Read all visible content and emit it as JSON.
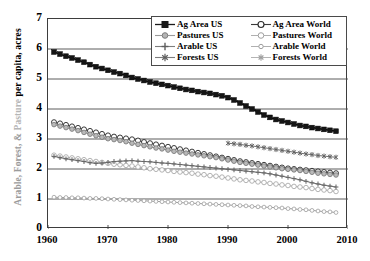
{
  "chart_data": {
    "type": "line",
    "title": "",
    "subtitle": "",
    "xlabel": "",
    "ylabel": "Arable, Forest, & Pasture per capita, acres",
    "ylabel_parts": [
      {
        "text": "Arable, Forest, & ",
        "color": "#9b9b9b"
      },
      {
        "text": "Pasture ",
        "color": "#b6b6b6"
      },
      {
        "text": "per capita, acres",
        "color": "#000000"
      }
    ],
    "xlim": [
      1960,
      2010
    ],
    "ylim": [
      0,
      7
    ],
    "xticks": [
      1960,
      1970,
      1980,
      1990,
      2000,
      2010
    ],
    "yticks": [
      0,
      1,
      2,
      3,
      4,
      5,
      6,
      7
    ],
    "grid": "horizontal",
    "legend_position": "top-right-inside",
    "series": [
      {
        "name": "Ag Area US",
        "marker": "filled-square",
        "color": "#1a1a1a",
        "x": [
          1961,
          1962,
          1963,
          1964,
          1965,
          1966,
          1967,
          1968,
          1969,
          1970,
          1971,
          1972,
          1973,
          1974,
          1975,
          1976,
          1977,
          1978,
          1979,
          1980,
          1981,
          1982,
          1983,
          1984,
          1985,
          1986,
          1987,
          1988,
          1989,
          1990,
          1991,
          1992,
          1993,
          1994,
          1995,
          1996,
          1997,
          1998,
          1999,
          2000,
          2001,
          2002,
          2003,
          2004,
          2005,
          2006,
          2007,
          2008
        ],
        "values": [
          5.9,
          5.83,
          5.76,
          5.7,
          5.63,
          5.56,
          5.48,
          5.41,
          5.35,
          5.29,
          5.23,
          5.18,
          5.12,
          5.05,
          5.0,
          4.95,
          4.9,
          4.86,
          4.82,
          4.78,
          4.73,
          4.69,
          4.65,
          4.62,
          4.58,
          4.55,
          4.52,
          4.48,
          4.44,
          4.38,
          4.3,
          4.2,
          4.1,
          4.0,
          3.9,
          3.8,
          3.72,
          3.65,
          3.6,
          3.55,
          3.5,
          3.45,
          3.42,
          3.38,
          3.35,
          3.32,
          3.29,
          3.26
        ]
      },
      {
        "name": "Ag Area World",
        "marker": "open-circle",
        "color": "#3a3a3a",
        "x": [
          1961,
          1962,
          1963,
          1964,
          1965,
          1966,
          1967,
          1968,
          1969,
          1970,
          1971,
          1972,
          1973,
          1974,
          1975,
          1976,
          1977,
          1978,
          1979,
          1980,
          1981,
          1982,
          1983,
          1984,
          1985,
          1986,
          1987,
          1988,
          1989,
          1990,
          1991,
          1992,
          1993,
          1994,
          1995,
          1996,
          1997,
          1998,
          1999,
          2000,
          2001,
          2002,
          2003,
          2004,
          2005,
          2006,
          2007,
          2008
        ],
        "values": [
          3.56,
          3.52,
          3.47,
          3.42,
          3.37,
          3.32,
          3.27,
          3.22,
          3.17,
          3.12,
          3.08,
          3.05,
          3.02,
          2.99,
          2.95,
          2.9,
          2.86,
          2.82,
          2.78,
          2.74,
          2.7,
          2.66,
          2.62,
          2.58,
          2.54,
          2.5,
          2.46,
          2.42,
          2.38,
          2.34,
          2.3,
          2.26,
          2.23,
          2.2,
          2.17,
          2.14,
          2.11,
          2.08,
          2.05,
          2.02,
          2.0,
          1.98,
          1.96,
          1.94,
          1.92,
          1.9,
          1.88,
          1.86
        ]
      },
      {
        "name": "Pastures US",
        "marker": "filled-circle-gray",
        "color": "#8c8c8c",
        "x": [
          1961,
          1962,
          1963,
          1964,
          1965,
          1966,
          1967,
          1968,
          1969,
          1970,
          1971,
          1972,
          1973,
          1974,
          1975,
          1976,
          1977,
          1978,
          1979,
          1980,
          1981,
          1982,
          1983,
          1984,
          1985,
          1986,
          1987,
          1988,
          1989,
          1990,
          1991,
          1992,
          1993,
          1994,
          1995,
          1996,
          1997,
          1998,
          1999,
          2000,
          2001,
          2002,
          2003,
          2004,
          2005,
          2006,
          2007,
          2008
        ],
        "values": [
          3.48,
          3.43,
          3.38,
          3.33,
          3.28,
          3.22,
          3.16,
          3.11,
          3.06,
          3.01,
          2.98,
          2.95,
          2.91,
          2.86,
          2.82,
          2.78,
          2.74,
          2.7,
          2.67,
          2.63,
          2.59,
          2.56,
          2.53,
          2.5,
          2.47,
          2.44,
          2.41,
          2.38,
          2.34,
          2.3,
          2.26,
          2.22,
          2.19,
          2.16,
          2.13,
          2.1,
          2.07,
          2.04,
          2.01,
          1.99,
          1.97,
          1.95,
          1.92,
          1.89,
          1.86,
          1.84,
          1.82,
          1.8
        ]
      },
      {
        "name": "Pastures World",
        "marker": "open-circle-light",
        "color": "#a8a8a8",
        "x": [
          1961,
          1962,
          1963,
          1964,
          1965,
          1966,
          1967,
          1968,
          1969,
          1970,
          1971,
          1972,
          1973,
          1974,
          1975,
          1976,
          1977,
          1978,
          1979,
          1980,
          1981,
          1982,
          1983,
          1984,
          1985,
          1986,
          1987,
          1988,
          1989,
          1990,
          1991,
          1992,
          1993,
          1994,
          1995,
          1996,
          1997,
          1998,
          1999,
          2000,
          2001,
          2002,
          2003,
          2004,
          2005,
          2006,
          2007,
          2008
        ],
        "values": [
          2.46,
          2.43,
          2.4,
          2.37,
          2.34,
          2.31,
          2.28,
          2.25,
          2.22,
          2.19,
          2.16,
          2.14,
          2.12,
          2.1,
          2.07,
          2.04,
          2.01,
          1.99,
          1.97,
          1.95,
          1.92,
          1.9,
          1.88,
          1.86,
          1.83,
          1.81,
          1.78,
          1.76,
          1.73,
          1.7,
          1.67,
          1.64,
          1.62,
          1.6,
          1.57,
          1.55,
          1.52,
          1.5,
          1.47,
          1.45,
          1.42,
          1.4,
          1.38,
          1.35,
          1.32,
          1.3,
          1.28,
          1.25
        ]
      },
      {
        "name": "Arable US",
        "marker": "plus-gray",
        "color": "#6e6e6e",
        "x": [
          1961,
          1962,
          1963,
          1964,
          1965,
          1966,
          1967,
          1968,
          1969,
          1970,
          1971,
          1972,
          1973,
          1974,
          1975,
          1976,
          1977,
          1978,
          1979,
          1980,
          1981,
          1982,
          1983,
          1984,
          1985,
          1986,
          1987,
          1988,
          1989,
          1990,
          1991,
          1992,
          1993,
          1994,
          1995,
          1996,
          1997,
          1998,
          1999,
          2000,
          2001,
          2002,
          2003,
          2004,
          2005,
          2006,
          2007,
          2008
        ],
        "values": [
          2.42,
          2.38,
          2.34,
          2.31,
          2.28,
          2.25,
          2.21,
          2.19,
          2.2,
          2.22,
          2.25,
          2.26,
          2.27,
          2.28,
          2.26,
          2.25,
          2.24,
          2.22,
          2.2,
          2.19,
          2.17,
          2.15,
          2.13,
          2.11,
          2.09,
          2.07,
          2.05,
          2.03,
          2.01,
          1.99,
          1.97,
          1.95,
          1.93,
          1.91,
          1.89,
          1.87,
          1.84,
          1.8,
          1.76,
          1.72,
          1.68,
          1.64,
          1.59,
          1.54,
          1.5,
          1.46,
          1.43,
          1.4
        ]
      },
      {
        "name": "Arable World",
        "marker": "open-circle-tiny",
        "color": "#a0a0a0",
        "x": [
          1961,
          1962,
          1963,
          1964,
          1965,
          1966,
          1967,
          1968,
          1969,
          1970,
          1971,
          1972,
          1973,
          1974,
          1975,
          1976,
          1977,
          1978,
          1979,
          1980,
          1981,
          1982,
          1983,
          1984,
          1985,
          1986,
          1987,
          1988,
          1989,
          1990,
          1991,
          1992,
          1993,
          1994,
          1995,
          1996,
          1997,
          1998,
          1999,
          2000,
          2001,
          2002,
          2003,
          2004,
          2005,
          2006,
          2007,
          2008
        ],
        "values": [
          1.06,
          1.05,
          1.05,
          1.04,
          1.04,
          1.03,
          1.02,
          1.02,
          1.01,
          1.0,
          0.99,
          0.98,
          0.97,
          0.96,
          0.95,
          0.94,
          0.93,
          0.92,
          0.91,
          0.9,
          0.89,
          0.88,
          0.87,
          0.86,
          0.85,
          0.84,
          0.83,
          0.82,
          0.81,
          0.8,
          0.79,
          0.78,
          0.77,
          0.75,
          0.74,
          0.73,
          0.72,
          0.71,
          0.7,
          0.68,
          0.67,
          0.65,
          0.64,
          0.62,
          0.6,
          0.58,
          0.57,
          0.55
        ]
      },
      {
        "name": "Forests US",
        "marker": "star-gray",
        "color": "#6b6b6b",
        "x": [
          1990,
          1991,
          1992,
          1993,
          1994,
          1995,
          1996,
          1997,
          1998,
          1999,
          2000,
          2001,
          2002,
          2003,
          2004,
          2005,
          2006,
          2007,
          2008
        ],
        "values": [
          2.86,
          2.84,
          2.82,
          2.79,
          2.77,
          2.74,
          2.71,
          2.68,
          2.65,
          2.62,
          2.59,
          2.56,
          2.53,
          2.5,
          2.48,
          2.45,
          2.43,
          2.41,
          2.39
        ]
      },
      {
        "name": "Forests World",
        "marker": "star-open",
        "color": "#b0b0b0",
        "x": [],
        "values": []
      }
    ]
  },
  "legend": {
    "items": [
      {
        "label": "Ag Area US",
        "marker": "filled-square",
        "color": "#1a1a1a"
      },
      {
        "label": "Ag Area World",
        "marker": "open-circle",
        "color": "#3a3a3a"
      },
      {
        "label": "Pastures US",
        "marker": "filled-circle-gray",
        "color": "#8c8c8c"
      },
      {
        "label": "Pastures World",
        "marker": "open-circle-light",
        "color": "#a8a8a8"
      },
      {
        "label": "Arable US",
        "marker": "plus-gray",
        "color": "#6e6e6e"
      },
      {
        "label": "Arable World",
        "marker": "open-circle-tiny",
        "color": "#a0a0a0"
      },
      {
        "label": "Forests US",
        "marker": "star-gray",
        "color": "#6b6b6b"
      },
      {
        "label": "Forests World",
        "marker": "star-open",
        "color": "#b0b0b0"
      }
    ]
  },
  "axes": {
    "ylabel_full": "Arable, Forest, & Pasture per capita, acres",
    "xticklabels": [
      "1960",
      "1970",
      "1980",
      "1990",
      "2000",
      "2010"
    ],
    "yticklabels": [
      "0",
      "1",
      "2",
      "3",
      "4",
      "5",
      "6",
      "7"
    ]
  }
}
